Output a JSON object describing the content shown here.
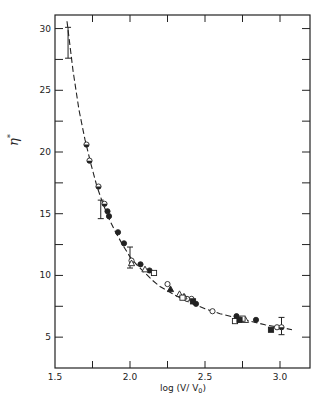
{
  "chart_data": {
    "type": "scatter",
    "title": "",
    "xlabel": "log (V/ V₀)",
    "xlabel_main": "log (V/ V",
    "xlabel_sub": "0",
    "xlabel_close": ")",
    "ylabel": "η*",
    "ylabel_main": "η",
    "ylabel_sup": "*",
    "xlim": [
      1.5,
      3.2
    ],
    "ylim": [
      2.5,
      31.1
    ],
    "xticks": [
      1.5,
      2.0,
      2.5,
      3.0
    ],
    "xtick_labels": [
      "1.5",
      "2.0",
      "2.5",
      "3.0"
    ],
    "xminor_ticks": [
      1.75,
      2.25,
      2.75
    ],
    "yticks": [
      5,
      10,
      15,
      20,
      25,
      30
    ],
    "ytick_labels": [
      "5",
      "10",
      "15",
      "20",
      "25",
      "30"
    ],
    "yminor_ticks": [
      7.5,
      12.5,
      17.5,
      22.5,
      27.5
    ],
    "grid": false,
    "legend": "none",
    "fit_curve": {
      "style": "dashed",
      "x": [
        1.58,
        1.62,
        1.66,
        1.7,
        1.74,
        1.78,
        1.82,
        1.86,
        1.9,
        1.95,
        2.0,
        2.05,
        2.1,
        2.15,
        2.2,
        2.3,
        2.4,
        2.5,
        2.6,
        2.7,
        2.8,
        2.9,
        3.0,
        3.08
      ],
      "y": [
        30.6,
        26.6,
        23.4,
        21.0,
        19.0,
        17.2,
        15.8,
        14.6,
        13.6,
        12.5,
        11.5,
        10.8,
        10.2,
        9.6,
        9.1,
        8.4,
        7.8,
        7.3,
        6.9,
        6.6,
        6.3,
        6.0,
        5.8,
        5.6
      ]
    },
    "series": [
      {
        "name": "open-circles",
        "marker": "open-circle",
        "points": [
          [
            2.01,
            11.2
          ],
          [
            2.25,
            9.3
          ],
          [
            2.41,
            8.1
          ],
          [
            2.55,
            7.1
          ],
          [
            2.38,
            8.1
          ],
          [
            2.98,
            5.8
          ]
        ]
      },
      {
        "name": "half-filled-circles",
        "marker": "half-circle",
        "points": [
          [
            1.71,
            20.6
          ],
          [
            1.73,
            19.3
          ],
          [
            1.79,
            17.2
          ],
          [
            1.83,
            15.8
          ],
          [
            3.01,
            5.8
          ]
        ]
      },
      {
        "name": "filled-circles",
        "marker": "filled-circle",
        "points": [
          [
            1.85,
            15.2
          ],
          [
            1.86,
            14.8
          ],
          [
            1.92,
            13.5
          ],
          [
            1.96,
            12.6
          ],
          [
            2.07,
            10.9
          ],
          [
            2.13,
            10.4
          ],
          [
            2.44,
            7.7
          ],
          [
            2.84,
            6.4
          ],
          [
            2.71,
            6.7
          ]
        ]
      },
      {
        "name": "open-triangles",
        "marker": "open-triangle",
        "points": [
          [
            2.01,
            11.0
          ],
          [
            2.1,
            10.5
          ],
          [
            2.33,
            8.5
          ],
          [
            2.36,
            8.3
          ],
          [
            2.77,
            6.4
          ]
        ]
      },
      {
        "name": "filled-triangles",
        "marker": "filled-triangle",
        "points": [
          [
            2.27,
            8.9
          ],
          [
            2.71,
            6.6
          ]
        ]
      },
      {
        "name": "open-squares",
        "marker": "open-square",
        "points": [
          [
            2.16,
            10.2
          ],
          [
            2.35,
            8.2
          ],
          [
            2.7,
            6.3
          ],
          [
            2.75,
            6.5
          ]
        ]
      },
      {
        "name": "filled-squares",
        "marker": "filled-square",
        "points": [
          [
            2.42,
            7.9
          ],
          [
            2.73,
            6.4
          ],
          [
            2.94,
            5.6
          ]
        ]
      }
    ],
    "error_bars": [
      {
        "x": 1.587,
        "y_low": 27.6,
        "y_high": 30.1
      },
      {
        "x": 1.805,
        "y_low": 14.6,
        "y_high": 16.1
      },
      {
        "x": 2.0,
        "y_low": 10.6,
        "y_high": 12.3
      },
      {
        "x": 3.01,
        "y_low": 5.2,
        "y_high": 6.6
      }
    ]
  }
}
